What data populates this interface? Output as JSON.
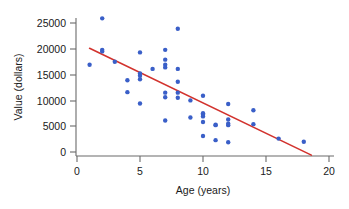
{
  "chart_data": {
    "type": "scatter",
    "title": "",
    "xlabel": "Age (years)",
    "ylabel": "Value (dollars)",
    "xlim": [
      0,
      20
    ],
    "ylim": [
      0,
      26500
    ],
    "grid": false,
    "legend": null,
    "xticks": [
      0,
      5,
      10,
      15,
      20
    ],
    "xtick_labels": [
      "0",
      "5",
      "10",
      "15",
      "20"
    ],
    "yticks": [
      0,
      5000,
      10000,
      15000,
      20000,
      25000
    ],
    "ytick_labels": [
      "0",
      "5000",
      "10000",
      "15000",
      "20000",
      "25000"
    ],
    "point_color": "#3a5fc8",
    "line_color": "#d2322d",
    "axis_color": "#6b6b6b",
    "series": [
      {
        "name": "Used car value",
        "marker": "circle",
        "points": [
          [
            1,
            16900
          ],
          [
            2,
            25900
          ],
          [
            2,
            19800
          ],
          [
            2,
            19500
          ],
          [
            3,
            17500
          ],
          [
            4,
            13900
          ],
          [
            4,
            11600
          ],
          [
            5,
            19300
          ],
          [
            5,
            15200
          ],
          [
            5,
            14800
          ],
          [
            5,
            14100
          ],
          [
            5,
            9400
          ],
          [
            6,
            16100
          ],
          [
            7,
            19800
          ],
          [
            7,
            17900
          ],
          [
            7,
            16900
          ],
          [
            7,
            16400
          ],
          [
            7,
            11500
          ],
          [
            7,
            10600
          ],
          [
            7,
            6100
          ],
          [
            8,
            23900
          ],
          [
            8,
            16100
          ],
          [
            8,
            13600
          ],
          [
            8,
            11500
          ],
          [
            8,
            10500
          ],
          [
            9,
            10000
          ],
          [
            9,
            6700
          ],
          [
            10,
            10900
          ],
          [
            10,
            7500
          ],
          [
            10,
            7200
          ],
          [
            10,
            6900
          ],
          [
            10,
            5800
          ],
          [
            10,
            3100
          ],
          [
            11,
            5300
          ],
          [
            11,
            5200
          ],
          [
            11,
            2300
          ],
          [
            12,
            9300
          ],
          [
            12,
            6300
          ],
          [
            12,
            5500
          ],
          [
            12,
            5200
          ],
          [
            12,
            1900
          ],
          [
            14,
            8100
          ],
          [
            14,
            5400
          ],
          [
            16,
            2600
          ],
          [
            18,
            2000
          ]
        ]
      }
    ],
    "trend_line": {
      "name": "least-squares regression line",
      "x_start": 1.0,
      "y_start": 20100,
      "x_end": 18.6,
      "y_end": -600
    }
  },
  "axes": {
    "y_axis_title": "Value (dollars)",
    "x_axis_title": "Age (years)"
  }
}
